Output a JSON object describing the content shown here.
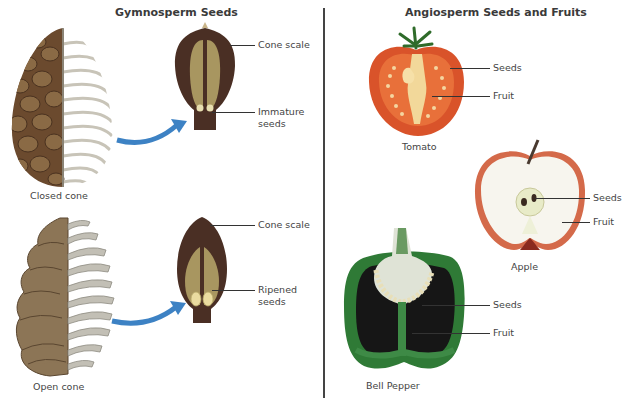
{
  "left_panel": {
    "title": "Gymnosperm Seeds",
    "closed_cone": {
      "caption": "Closed cone",
      "labels": [
        "Cone scale",
        "Immature",
        "seeds"
      ]
    },
    "open_cone": {
      "caption": "Open cone",
      "labels": [
        "Cone scale",
        "Ripened",
        "seeds"
      ]
    }
  },
  "right_panel": {
    "title": "Angiosperm Seeds and Fruits",
    "tomato": {
      "caption": "Tomato",
      "labels": [
        "Seeds",
        "Fruit"
      ]
    },
    "apple": {
      "caption": "Apple",
      "labels": [
        "Seeds",
        "Fruit"
      ]
    },
    "bell_pepper": {
      "caption": "Bell Pepper",
      "labels": [
        "Seeds",
        "Fruit"
      ]
    }
  },
  "colors": {
    "cone_brown": "#6b4a2e",
    "scale_dark": "#4a2f24",
    "seed_wing": "#a89660",
    "arrow_blue": "#3d82c4",
    "tomato_red": "#d9532a",
    "apple_flesh": "#f7f5ee",
    "pepper_green": "#2f7a36",
    "divider": "#444444"
  }
}
